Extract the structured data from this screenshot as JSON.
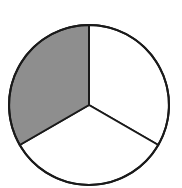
{
  "chart_data": {
    "type": "pie",
    "title": "",
    "categories": [
      "Slice 1",
      "Slice 2",
      "Slice 3"
    ],
    "values": [
      1,
      1,
      1
    ],
    "shaded": [
      false,
      false,
      true
    ],
    "fraction_shaded": "1/3",
    "colors": {
      "shaded": "#8e8e8e",
      "unshaded": "#ffffff",
      "stroke": "#1a1a1a"
    },
    "start_angle_deg": -90,
    "legend": "none"
  },
  "geometry": {
    "cx": 89,
    "cy": 105,
    "r": 80
  }
}
